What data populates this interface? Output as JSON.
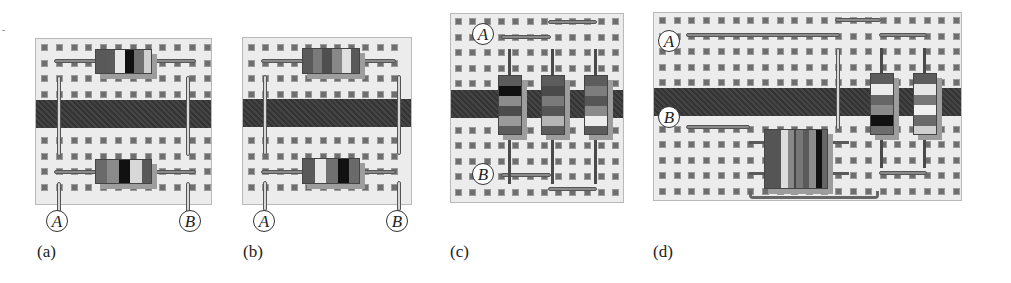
{
  "figure": {
    "panels": [
      {
        "id": "a",
        "caption": "(a)",
        "caption_pos": [
          37,
          242
        ],
        "board": {
          "x": 35,
          "y": 38,
          "w": 177,
          "h": 167,
          "cols": 12,
          "rows": 10,
          "hole_x0": 5,
          "hole_y0": 5,
          "pitch_x": 14.8,
          "pitch_y": 15.5,
          "channel": {
            "y": 61,
            "h": 28
          },
          "skip_rows_for_channel": true
        },
        "nodes": [
          {
            "label": "A",
            "x": 46,
            "y": 210
          },
          {
            "label": "B",
            "x": 179,
            "y": 210
          }
        ],
        "wires_h": [
          {
            "x": 18,
            "y": 20,
            "w": 50
          },
          {
            "x": 112,
            "y": 20,
            "w": 48
          },
          {
            "x": 18,
            "y": 131,
            "w": 50
          },
          {
            "x": 112,
            "y": 131,
            "w": 48
          }
        ],
        "wires_v": [
          {
            "x": 21,
            "y": 37,
            "h": 80
          },
          {
            "x": 150,
            "y": 37,
            "h": 80
          },
          {
            "x": 21,
            "y": 143,
            "h": 30
          },
          {
            "x": 150,
            "y": 143,
            "h": 30
          }
        ],
        "resistors": [
          {
            "orient": "h",
            "x": 59,
            "y": 10,
            "w": 57,
            "h": 25,
            "bands": [
              "#595959",
              "#5a5a5a",
              "#e6e6e6",
              "#111",
              "#707070",
              "#d0d0d0"
            ]
          },
          {
            "orient": "h",
            "x": 59,
            "y": 120,
            "w": 57,
            "h": 25,
            "bands": [
              "#6a6a6a",
              "#8a8a8a",
              "#111",
              "#d8d8d8",
              "#595959"
            ]
          }
        ]
      },
      {
        "id": "b",
        "caption": "(b)",
        "caption_pos": [
          243,
          242
        ],
        "board": {
          "x": 242,
          "y": 37,
          "w": 170,
          "h": 168,
          "cols": 12,
          "rows": 10,
          "hole_x0": 5,
          "hole_y0": 6,
          "pitch_x": 14.3,
          "pitch_y": 15.5,
          "channel": {
            "y": 61,
            "h": 28
          },
          "skip_rows_for_channel": true
        },
        "nodes": [
          {
            "label": "A",
            "x": 253,
            "y": 210
          },
          {
            "label": "B",
            "x": 386,
            "y": 210
          }
        ],
        "wires_h": [
          {
            "x": 18,
            "y": 21,
            "w": 48
          },
          {
            "x": 105,
            "y": 21,
            "w": 48
          },
          {
            "x": 18,
            "y": 132,
            "w": 48
          },
          {
            "x": 105,
            "y": 132,
            "w": 48
          }
        ],
        "wires_v": [
          {
            "x": 20,
            "y": 37,
            "h": 80
          },
          {
            "x": 154,
            "y": 37,
            "h": 80
          },
          {
            "x": 20,
            "y": 143,
            "h": 30
          },
          {
            "x": 154,
            "y": 143,
            "h": 30
          }
        ],
        "resistors": [
          {
            "orient": "h",
            "x": 59,
            "y": 10,
            "w": 58,
            "h": 26,
            "bands": [
              "#5a5a5a",
              "#7a7a7a",
              "#4f4f4f",
              "#888",
              "#e0e0e0",
              "#595959"
            ]
          },
          {
            "orient": "h",
            "x": 59,
            "y": 120,
            "w": 58,
            "h": 26,
            "bands": [
              "#595959",
              "#e6e6e6",
              "#707070",
              "#111",
              "#6a6a6a"
            ]
          }
        ]
      },
      {
        "id": "c",
        "caption": "(c)",
        "caption_pos": [
          450,
          242
        ],
        "board": {
          "x": 450,
          "y": 13,
          "w": 174,
          "h": 190,
          "cols": 12,
          "rows": 12,
          "hole_x0": 4,
          "hole_y0": 4,
          "pitch_x": 14.3,
          "pitch_y": 15.5,
          "channel": {
            "y": 76,
            "h": 28
          },
          "skip_rows_for_channel": true
        },
        "nodes": [
          {
            "label": "A",
            "x": 472,
            "y": 23
          },
          {
            "label": "B",
            "x": 472,
            "y": 163
          }
        ],
        "wires_h": [
          {
            "x": 50,
            "y": 21,
            "w": 50
          },
          {
            "x": 97,
            "y": 6,
            "w": 49
          },
          {
            "x": 50,
            "y": 159,
            "w": 50
          },
          {
            "x": 97,
            "y": 173,
            "w": 49
          }
        ],
        "wires_v": [],
        "leads_v": [
          {
            "x": 57,
            "y": 35,
            "h": 135
          },
          {
            "x": 100,
            "y": 35,
            "h": 135
          },
          {
            "x": 143,
            "y": 35,
            "h": 135
          }
        ],
        "resistors": [
          {
            "orient": "v",
            "x": 47,
            "y": 61,
            "w": 24,
            "h": 60,
            "bands": [
              "#5c5c5c",
              "#111",
              "#8c8c8c",
              "#4c4c4c",
              "#9a9a9a",
              "#5c5c5c"
            ]
          },
          {
            "orient": "v",
            "x": 90,
            "y": 61,
            "w": 24,
            "h": 60,
            "bands": [
              "#5c5c5c",
              "#4a4a4a",
              "#7a7a7a",
              "#555",
              "#b5b5b5",
              "#5c5c5c"
            ]
          },
          {
            "orient": "v",
            "x": 133,
            "y": 61,
            "w": 24,
            "h": 60,
            "bands": [
              "#5c5c5c",
              "#7d7d7d",
              "#565656",
              "#8a8a8a",
              "#ededed",
              "#5c5c5c"
            ]
          }
        ]
      },
      {
        "id": "d",
        "caption": "(d)",
        "caption_pos": [
          653,
          242
        ],
        "board": {
          "x": 653,
          "y": 12,
          "w": 309,
          "h": 189,
          "cols": 21,
          "rows": 12,
          "hole_x0": 5,
          "hole_y0": 4,
          "pitch_x": 14.7,
          "pitch_y": 15.5,
          "channel": {
            "y": 75,
            "h": 28
          },
          "skip_rows_for_channel": true
        },
        "nodes": [
          {
            "label": "A",
            "x": 658,
            "y": 30
          },
          {
            "label": "B",
            "x": 658,
            "y": 106
          }
        ],
        "wires_h": [
          {
            "x": 32,
            "y": 20,
            "w": 154
          },
          {
            "x": 181,
            "y": 5,
            "w": 46
          },
          {
            "x": 225,
            "y": 20,
            "w": 48
          },
          {
            "x": 32,
            "y": 112,
            "w": 64
          },
          {
            "x": 225,
            "y": 158,
            "w": 48
          }
        ],
        "wires_v": [
          {
            "x": 182,
            "y": 35,
            "h": 82
          }
        ],
        "leads_v": [
          {
            "x": 226,
            "y": 35,
            "h": 120
          },
          {
            "x": 269,
            "y": 35,
            "h": 120
          }
        ],
        "leads_h": [
          {
            "x": 95,
            "y": 128,
            "w": 100
          },
          {
            "x": 95,
            "y": 159,
            "w": 100
          }
        ],
        "tray": {
          "x": 95,
          "y": 178,
          "w": 130,
          "h": 8
        },
        "resistors": [
          {
            "orient": "v",
            "x": 216,
            "y": 60,
            "w": 24,
            "h": 62,
            "bands": [
              "#5c5c5c",
              "#ebebeb",
              "#666",
              "#8a8a8a",
              "#111",
              "#6d6d6d"
            ]
          },
          {
            "orient": "v",
            "x": 259,
            "y": 60,
            "w": 24,
            "h": 62,
            "bands": [
              "#5c5c5c",
              "#e6e6e6",
              "#777",
              "#f0f0f0",
              "#6a6a6a",
              "#cfcfcf"
            ]
          },
          {
            "orient": "h",
            "x": 110,
            "y": 116,
            "w": 31,
            "h": 60,
            "bands": [
              "#555",
              "#555",
              "#ddd",
              "#888"
            ]
          },
          {
            "orient": "h",
            "x": 141,
            "y": 116,
            "w": 33,
            "h": 60,
            "bands": [
              "#777",
              "#5a5a5a",
              "#8c8c8c",
              "#111",
              "#666"
            ]
          }
        ]
      }
    ],
    "side_mark": {
      "text": "-",
      "x": 2,
      "y": 24
    }
  }
}
